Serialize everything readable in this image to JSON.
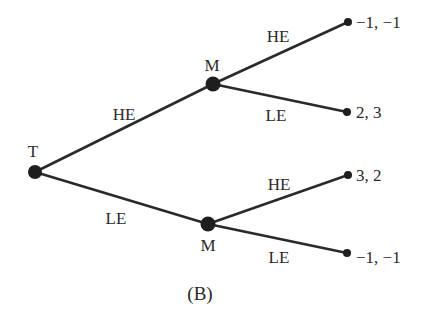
{
  "diagram": {
    "type": "game-tree",
    "caption": "(B)",
    "nodes": {
      "root": {
        "label": "T",
        "x": 35,
        "y": 172,
        "r": 7
      },
      "m_top": {
        "label": "M",
        "x": 213,
        "y": 84,
        "r": 7.5
      },
      "m_bottom": {
        "label": "M",
        "x": 208,
        "y": 224,
        "r": 7.5
      }
    },
    "edges": [
      {
        "from": "T",
        "to": "M (top)",
        "label": "HE"
      },
      {
        "from": "T",
        "to": "M (bottom)",
        "label": "LE"
      },
      {
        "from": "M (top)",
        "to": "terminal 1",
        "label": "HE"
      },
      {
        "from": "M (top)",
        "to": "terminal 2",
        "label": "LE"
      },
      {
        "from": "M (bottom)",
        "to": "terminal 3",
        "label": "HE"
      },
      {
        "from": "M (bottom)",
        "to": "terminal 4",
        "label": "LE"
      }
    ],
    "terminals": [
      {
        "payoff": "−1, −1",
        "x": 348,
        "y": 22
      },
      {
        "payoff": "2, 3",
        "x": 347,
        "y": 112
      },
      {
        "payoff": "3, 2",
        "x": 348,
        "y": 175
      },
      {
        "payoff": "−1, −1",
        "x": 347,
        "y": 253
      }
    ]
  }
}
